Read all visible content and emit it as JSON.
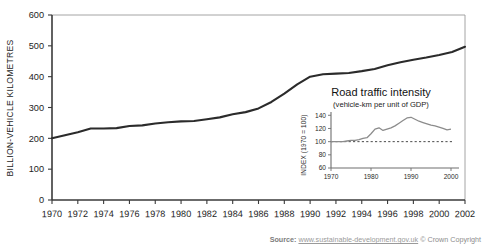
{
  "source": {
    "label": "Source:",
    "url": "www.sustainable-development.gov.uk",
    "copyright": "© Crown Copyright"
  },
  "chart_data": [
    {
      "id": "main",
      "type": "line",
      "title": "",
      "xlabel": "",
      "ylabel": "BILLION-VEHICLE KILOMETRES",
      "xlim": [
        1970,
        2002
      ],
      "ylim": [
        0,
        600
      ],
      "grid": false,
      "legend": "none",
      "yticks": [
        0,
        100,
        200,
        300,
        400,
        500,
        600
      ],
      "ytick_labels": [
        "0",
        "100",
        "200",
        "300",
        "400",
        "500",
        "600"
      ],
      "xticks": [
        1970,
        1972,
        1974,
        1976,
        1978,
        1980,
        1982,
        1984,
        1986,
        1988,
        1990,
        1992,
        1994,
        1996,
        1998,
        2000,
        2002
      ],
      "xtick_labels": [
        "1970",
        "1972",
        "1974",
        "1976",
        "1978",
        "1980",
        "1982",
        "1984",
        "1986",
        "1988",
        "1990",
        "1992",
        "1994",
        "1996",
        "1998",
        "2000",
        "2002"
      ],
      "series": [
        {
          "name": "Road traffic",
          "color": "#2b2b2b",
          "x": [
            1970,
            1971,
            1972,
            1973,
            1974,
            1975,
            1976,
            1977,
            1978,
            1979,
            1980,
            1981,
            1982,
            1983,
            1984,
            1985,
            1986,
            1987,
            1988,
            1989,
            1990,
            1991,
            1992,
            1993,
            1994,
            1995,
            1996,
            1997,
            1998,
            1999,
            2000,
            2001,
            2002
          ],
          "values": [
            200,
            210,
            220,
            232,
            232,
            233,
            240,
            242,
            248,
            252,
            255,
            256,
            262,
            268,
            278,
            285,
            297,
            318,
            345,
            375,
            400,
            408,
            410,
            412,
            418,
            425,
            437,
            447,
            455,
            462,
            470,
            480,
            497
          ]
        }
      ]
    },
    {
      "id": "inset",
      "type": "line",
      "title": "Road traffic intensity",
      "subtitle": "(vehicle-km per unit of GDP)",
      "xlabel": "",
      "ylabel": "INDEX (1970 = 100)",
      "xlim": [
        1970,
        2002
      ],
      "ylim": [
        60,
        145
      ],
      "grid": false,
      "legend": "none",
      "yticks": [
        60,
        80,
        100,
        120,
        140
      ],
      "ytick_labels": [
        "60",
        "80",
        "100",
        "120",
        "140"
      ],
      "xticks": [
        1970,
        1980,
        1990,
        2000
      ],
      "xtick_labels": [
        "1970",
        "1980",
        "1990",
        "2000"
      ],
      "reference_line": {
        "value": 100,
        "style": "dashed",
        "color": "#4a4a4a"
      },
      "series": [
        {
          "name": "Road traffic intensity index",
          "color": "#8c8c8c",
          "x": [
            1970,
            1971,
            1972,
            1973,
            1974,
            1975,
            1976,
            1977,
            1978,
            1979,
            1980,
            1981,
            1982,
            1983,
            1984,
            1985,
            1986,
            1987,
            1988,
            1989,
            1990,
            1991,
            1992,
            1993,
            1994,
            1995,
            1996,
            1997,
            1998,
            1999,
            2000
          ],
          "values": [
            100,
            100,
            100,
            100,
            101,
            102,
            102,
            103,
            105,
            106,
            112,
            119,
            121,
            117,
            119,
            121,
            124,
            128,
            132,
            136,
            137,
            134,
            131,
            129,
            127,
            125,
            124,
            122,
            120,
            118,
            119
          ]
        }
      ]
    }
  ]
}
